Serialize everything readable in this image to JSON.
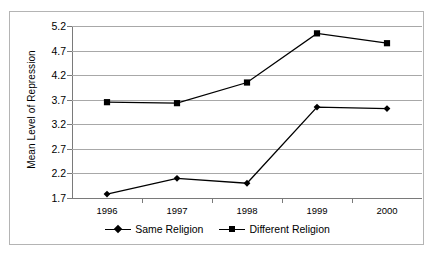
{
  "chart_data": {
    "type": "line",
    "title": "",
    "xlabel": "",
    "ylabel": "Mean Level of Repression",
    "categories": [
      "1996",
      "1997",
      "1998",
      "1999",
      "2000"
    ],
    "ylim": [
      1.7,
      5.2
    ],
    "yticks": [
      "1.7",
      "2.2",
      "2.7",
      "3.2",
      "3.7",
      "4.2",
      "4.7",
      "5.2"
    ],
    "ytick_step": 0.5,
    "grid": "horizontal",
    "legend_position": "bottom",
    "series": [
      {
        "name": "Same Religion",
        "marker": "diamond",
        "color": "#000000",
        "values": [
          1.78,
          2.1,
          2.0,
          3.55,
          3.52
        ]
      },
      {
        "name": "Different Religion",
        "marker": "square",
        "color": "#000000",
        "values": [
          3.65,
          3.63,
          4.05,
          5.05,
          4.85
        ]
      }
    ]
  },
  "legend": {
    "entries": [
      {
        "label": "Same Religion",
        "marker": "diamond-marker-icon"
      },
      {
        "label": "Different Religion",
        "marker": "square-marker-icon"
      }
    ]
  }
}
